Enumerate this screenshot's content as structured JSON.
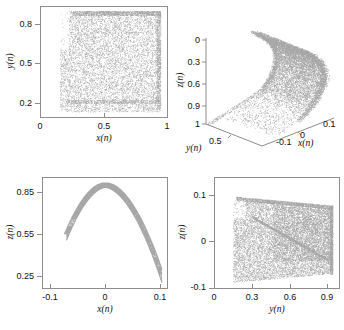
{
  "figure": {
    "panel_count": 4,
    "background": "#ffffff",
    "point_color": "#8a8a8a",
    "axis_color": "#8d8d8d"
  },
  "chart_data": [
    {
      "id": "panel-xy",
      "type": "scatter",
      "title": "",
      "xlabel": "x(n)",
      "ylabel": "y(n)",
      "xlim": [
        0,
        1
      ],
      "ylim": [
        0.1,
        0.95
      ],
      "xticks": [
        0,
        0.5,
        1
      ],
      "xticklabels": [
        "0",
        "0.5",
        "1"
      ],
      "yticks": [
        0.2,
        0.5,
        0.8
      ],
      "yticklabels": [
        "0.2",
        "0.5",
        "0.8"
      ],
      "grid": false,
      "legend": "none",
      "description": "Dense chaotic attractor cloud filling a near-square region",
      "data_extent": {
        "x_min": 0.15,
        "x_max": 0.95,
        "y_min": 0.14,
        "y_max": 0.92
      },
      "n_points": 6000
    },
    {
      "id": "panel-3d",
      "type": "scatter",
      "projection": "3d",
      "title": "",
      "xlabel": "x(n)",
      "ylabel": "y(n)",
      "zlabel": "z(n)",
      "xlim": [
        -0.1,
        0.1
      ],
      "ylim": [
        0.3,
        1.0
      ],
      "zlim": [
        0,
        1.0
      ],
      "xticks": [
        -0.1,
        0,
        0.1
      ],
      "xticklabels": [
        "-0.1",
        "0",
        "0.1"
      ],
      "yticks": [
        0.5,
        1
      ],
      "yticklabels": [
        "0.5",
        "1"
      ],
      "zticks": [
        0,
        0.3,
        0.6,
        0.9
      ],
      "zticklabels": [
        "0",
        "0.3",
        "0.6",
        "0.9"
      ],
      "zaxis_inverted": true,
      "grid": false,
      "legend": "none",
      "description": "Curved folded sheet of the attractor seen in 3D",
      "n_points": 6000
    },
    {
      "id": "panel-zx",
      "type": "scatter",
      "title": "",
      "xlabel": "x(n)",
      "ylabel": "z(n)",
      "xlim": [
        -0.115,
        0.115
      ],
      "ylim": [
        0.15,
        0.95
      ],
      "xticks": [
        -0.1,
        0,
        0.1
      ],
      "xticklabels": [
        "-0.1",
        "0",
        "0.1"
      ],
      "yticks": [
        0.25,
        0.55,
        0.85
      ],
      "yticklabels": [
        "0.25",
        "0.55",
        "0.85"
      ],
      "grid": false,
      "legend": "none",
      "description": "Parabolic arch / inverted-U ribbon with a notch on the left branch",
      "n_points": 6000
    },
    {
      "id": "panel-zy",
      "type": "scatter",
      "title": "",
      "xlabel": "y(n)",
      "ylabel": "z(n)",
      "xlim": [
        0,
        1.0
      ],
      "ylim": [
        -0.1,
        0.14
      ],
      "xticks": [
        0,
        0.3,
        0.6,
        0.9
      ],
      "xticklabels": [
        "0",
        "0.3",
        "0.6",
        "0.9"
      ],
      "yticks": [
        -0.1,
        0,
        0.1
      ],
      "yticklabels": [
        "-0.1",
        "0",
        "0.1"
      ],
      "grid": false,
      "legend": "none",
      "description": "Sheared quadrilateral cloud with internal folded banding",
      "n_points": 6000
    }
  ]
}
